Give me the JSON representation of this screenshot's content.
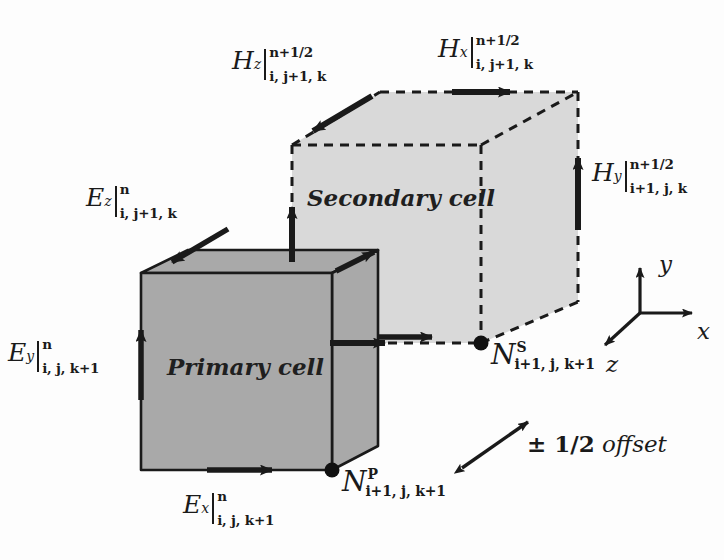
{
  "figure": {
    "colors": {
      "primary_fill": "#a9a9a9",
      "secondary_fill": "#d9d9d9",
      "stroke": "#1a1a1a",
      "background": "#fdfdfd"
    }
  },
  "cells": {
    "primary": {
      "name": "Primary cell",
      "line_style": "solid",
      "fill": "#a9a9a9"
    },
    "secondary": {
      "name": "Secondary cell",
      "line_style": "dashed",
      "fill": "#d9d9d9"
    }
  },
  "field_labels": [
    {
      "id": "Hz",
      "base": "H",
      "base_sub": "z",
      "superscript": "n+1/2",
      "subscript": "i, j+1, k",
      "x": 232,
      "y": 48
    },
    {
      "id": "Hx",
      "base": "H",
      "base_sub": "x",
      "superscript": "n+1/2",
      "subscript": "i, j+1, k",
      "x": 438,
      "y": 36
    },
    {
      "id": "Hy",
      "base": "H",
      "base_sub": "y",
      "superscript": "n+1/2",
      "subscript": "i+1, j, k",
      "x": 592,
      "y": 160
    },
    {
      "id": "Ez",
      "base": "E",
      "base_sub": "z",
      "superscript": "n",
      "subscript": "i, j+1, k",
      "x": 86,
      "y": 185
    },
    {
      "id": "Ey",
      "base": "E",
      "base_sub": "y",
      "superscript": "n",
      "subscript": "i, j, k+1",
      "x": 8,
      "y": 340
    },
    {
      "id": "Ex",
      "base": "E",
      "base_sub": "x",
      "superscript": "n",
      "subscript": "i, j, k+1",
      "x": 183,
      "y": 492
    }
  ],
  "nodes": [
    {
      "id": "NP",
      "base": "N",
      "superscript": "P",
      "subscript": "i+1, j, k+1",
      "label_x": 342,
      "label_y": 468,
      "dot_x": 332,
      "dot_y": 470
    },
    {
      "id": "NS",
      "base": "N",
      "superscript": "S",
      "subscript": "i+1, j, k+1",
      "label_x": 491,
      "label_y": 341,
      "dot_x": 481,
      "dot_y": 343
    }
  ],
  "annotations": {
    "offset": {
      "symbol": "± 1/2",
      "word": "offset",
      "x": 527,
      "y": 432
    }
  },
  "axes": {
    "origin_x": 640,
    "origin_y": 313,
    "labels": [
      {
        "id": "y",
        "text": "y",
        "x": 659,
        "y": 253
      },
      {
        "id": "x",
        "text": "x",
        "x": 697,
        "y": 320
      },
      {
        "id": "z",
        "text": "z",
        "x": 606,
        "y": 353
      }
    ]
  }
}
